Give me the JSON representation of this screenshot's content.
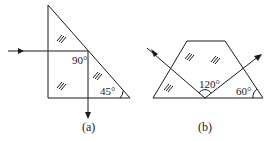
{
  "figures": [
    {
      "id": "a",
      "caption": "(a)",
      "shape": "right triangle prism",
      "angles": {
        "right_angle": "90°",
        "base_angle": "45°"
      }
    },
    {
      "id": "b",
      "caption": "(b)",
      "shape": "trapezoid prism",
      "angles": {
        "ray_angle": "120°",
        "base_angle": "60°"
      }
    }
  ],
  "colors": {
    "line": "#1a1a1a",
    "background": "#ffffff"
  }
}
